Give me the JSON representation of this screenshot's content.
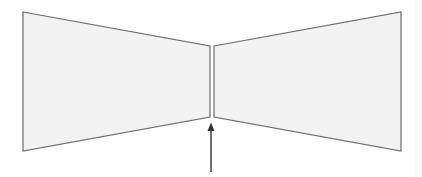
{
  "diagram": {
    "colors": {
      "background": "#ffffff",
      "panel_fill": "#f2f2f2",
      "panel_stroke": "#6a6a6a",
      "arrow": "#333333"
    },
    "left_panel": {
      "points": "23,12 210,46 210,117 23,151"
    },
    "right_panel": {
      "points": "214,46 401,12 401,151 214,117"
    },
    "arrow": {
      "x": 211,
      "tip_y": 123,
      "tail_y": 172
    }
  }
}
